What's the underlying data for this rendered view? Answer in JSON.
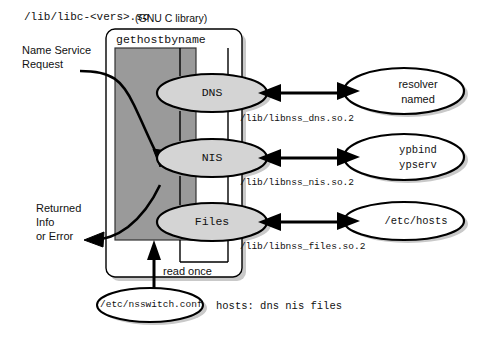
{
  "diagram": {
    "title": {
      "path": "/lib/libc-<vers>.so",
      "suffix": "(GNU C library)"
    },
    "library_box": {
      "function_label": "gethostbyname",
      "read_once_label": "read once"
    },
    "inputs": {
      "request_label_line1": "Name Service",
      "request_label_line2": "Request",
      "return_label_line1": "Returned",
      "return_label_line2": "Info",
      "return_label_line3": "or Error"
    },
    "service_nodes": [
      {
        "name": "dns-node",
        "label": "DNS",
        "module_path": "/lib/libnss_dns.so.2",
        "backend_label_line1": "resolver",
        "backend_label_line2": "named",
        "backend_font": "sans"
      },
      {
        "name": "nis-node",
        "label": "NIS",
        "module_path": "/lib/libnss_nis.so.2",
        "backend_label_line1": "ypbind",
        "backend_label_line2": "ypserv",
        "backend_font": "mono"
      },
      {
        "name": "files-node",
        "label": "Files",
        "module_path": "/lib/libnss_files.so.2",
        "backend_label_line1": "/etc/hosts",
        "backend_label_line2": "",
        "backend_font": "mono"
      }
    ],
    "config": {
      "file_label": "/etc/nsswitch.conf",
      "entry_label": "hosts: dns nis files"
    },
    "colors": {
      "gray_fill": "#9a9a9a",
      "ellipse_fill": "#d4d4d4",
      "white_fill": "#ffffff",
      "stroke": "#000000",
      "text": "#111111",
      "shadow": "#c9c9c9"
    }
  }
}
